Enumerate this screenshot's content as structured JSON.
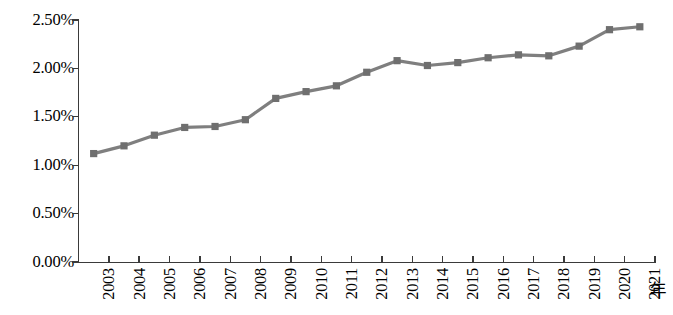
{
  "chart_data": {
    "type": "line",
    "title": "",
    "subtitle": "",
    "xlabel": "年",
    "ylabel": "",
    "grid": false,
    "legend": null,
    "legend_position": "none",
    "categories": [
      "2003",
      "2004",
      "2005",
      "2006",
      "2007",
      "2008",
      "2009",
      "2010",
      "2011",
      "2012",
      "2013",
      "2014",
      "2015",
      "2016",
      "2017",
      "2018",
      "2019",
      "2020",
      "2021"
    ],
    "values": [
      1.12,
      1.2,
      1.31,
      1.39,
      1.4,
      1.47,
      1.69,
      1.76,
      1.82,
      1.96,
      2.08,
      2.03,
      2.06,
      2.11,
      2.14,
      2.13,
      2.23,
      2.4,
      2.43
    ],
    "value_format": "percent",
    "ylim": [
      0.0,
      2.5
    ],
    "ytick_values": [
      0.0,
      0.5,
      1.0,
      1.5,
      2.0,
      2.5
    ],
    "ytick_labels": [
      "0.00%",
      "0.50%",
      "1.00%",
      "1.50%",
      "2.00%",
      "2.50%"
    ],
    "series": [
      {
        "name": "",
        "color": "#7f7f7f",
        "marker": "square",
        "values": [
          1.12,
          1.2,
          1.31,
          1.39,
          1.4,
          1.47,
          1.69,
          1.76,
          1.82,
          1.96,
          2.08,
          2.03,
          2.06,
          2.11,
          2.14,
          2.13,
          2.23,
          2.4,
          2.43
        ]
      }
    ],
    "annotations": []
  },
  "axes": {
    "x_unit_label": "年",
    "axis_color": "#3a3a3a"
  },
  "colors": {
    "line": "#7f7f7f",
    "marker": "#6f6f6f",
    "axis": "#3a3a3a",
    "text": "#000000",
    "background": "#ffffff"
  }
}
